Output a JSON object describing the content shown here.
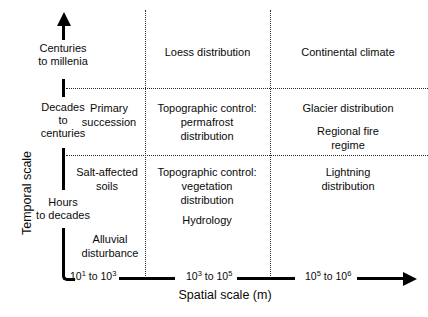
{
  "figure": {
    "type": "scale-matrix-diagram",
    "background": "#ffffff",
    "ink": "#000000"
  },
  "axes": {
    "y": {
      "title": "Temporal scale",
      "arrow": "up-arrow-icon",
      "tiers": [
        {
          "id": "centuries-to-millenia",
          "label": "Centuries\nto millenia"
        },
        {
          "id": "decades-to-centuries",
          "label": "Decades\nto\ncenturies"
        },
        {
          "id": "hours-to-decades",
          "label": "Hours\nto decades"
        }
      ]
    },
    "x": {
      "title": "Spatial scale (m)",
      "arrow": "right-arrow-icon",
      "ticks": [
        {
          "id": "tick-1",
          "base_low": "10",
          "exp_low": "1",
          "to": " to ",
          "base_high": "10",
          "exp_high": "3"
        },
        {
          "id": "tick-2",
          "base_low": "10",
          "exp_low": "3",
          "to": " to ",
          "base_high": "10",
          "exp_high": "5"
        },
        {
          "id": "tick-3",
          "base_low": "10",
          "exp_low": "5",
          "to": " to ",
          "base_high": "10",
          "exp_high": "6"
        }
      ]
    }
  },
  "cells": {
    "top_left": "",
    "top_mid": "Loess distribution",
    "top_right": "Continental climate",
    "mid_left_a": "Primary\nsuccession",
    "mid_mid": "Topographic control:\npermafrost\ndistribution",
    "mid_right_a": "Glacier distribution",
    "mid_right_b": "Regional fire\nregime",
    "low_left_a": "Salt-affected\nsoils",
    "low_left_b": "Alluvial\ndisturbance",
    "low_mid_a": "Topographic control:\nvegetation\ndistribution",
    "low_mid_b": "Hydrology",
    "low_right": "Lightning\ndistribution"
  }
}
